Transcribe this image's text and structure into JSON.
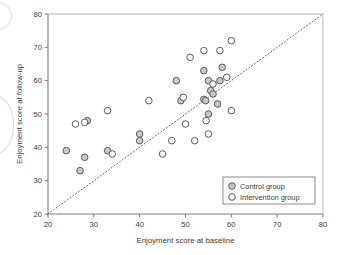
{
  "figure": {
    "width": 341,
    "height": 255,
    "background": "#ffffff"
  },
  "plot_area": {
    "left": 48,
    "top": 14,
    "right": 323,
    "bottom": 214
  },
  "colors": {
    "axis": "#7d7d7d",
    "frame": "#b9b9b9",
    "text": "#3a3a3a",
    "marker_stroke": "#5a5a5a",
    "control_fill": "#c9c9c9",
    "intervention_fill": "#ffffff",
    "reference_line": "#6e6e6e"
  },
  "legend": {
    "position": "bottom-right",
    "entries": [
      {
        "label": "Control group",
        "marker": "filled-circle",
        "fill": "#c9c9c9"
      },
      {
        "label": "Intervention group",
        "marker": "open-circle",
        "fill": "#ffffff"
      }
    ]
  },
  "annotations": {
    "reference_line_label": "line of equality",
    "scan_artifact_top": "partial-circle-artifact",
    "scan_artifact_mid": "partial-circle-artifact"
  },
  "chart_data": {
    "type": "scatter",
    "title": "",
    "subtitle": "",
    "xlabel": "Enjoyment score at baseline",
    "ylabel": "Enjoyment score at follow-up",
    "xlim": [
      20,
      80
    ],
    "ylim": [
      20,
      80
    ],
    "xticks": [
      20,
      30,
      40,
      50,
      60,
      70,
      80
    ],
    "yticks": [
      20,
      30,
      40,
      50,
      60,
      70,
      80
    ],
    "grid": false,
    "legend_position": "lower right",
    "reference_line": {
      "type": "identity",
      "style": "dotted",
      "from": [
        20,
        20
      ],
      "to": [
        80,
        80
      ]
    },
    "series": [
      {
        "name": "Control group",
        "marker": "filled-circle",
        "color": "#c9c9c9",
        "points": [
          [
            24,
            39
          ],
          [
            27,
            33
          ],
          [
            28,
            37
          ],
          [
            28.6,
            48
          ],
          [
            33,
            39
          ],
          [
            40,
            44
          ],
          [
            40,
            42
          ],
          [
            48,
            60
          ],
          [
            49,
            54
          ],
          [
            54,
            63
          ],
          [
            54,
            54.4
          ],
          [
            54.4,
            54
          ],
          [
            55,
            60
          ],
          [
            55,
            50
          ],
          [
            55.5,
            57
          ],
          [
            56,
            56
          ],
          [
            57,
            53
          ],
          [
            57.5,
            60
          ],
          [
            58,
            64
          ]
        ]
      },
      {
        "name": "Intervention group",
        "marker": "open-circle",
        "color": "#ffffff",
        "points": [
          [
            26,
            47
          ],
          [
            28,
            47.5
          ],
          [
            33,
            51
          ],
          [
            34,
            38
          ],
          [
            42,
            54
          ],
          [
            45,
            38
          ],
          [
            47,
            42
          ],
          [
            49.5,
            55
          ],
          [
            50,
            47
          ],
          [
            51,
            67
          ],
          [
            52,
            42
          ],
          [
            54,
            69
          ],
          [
            54.5,
            48
          ],
          [
            55,
            44
          ],
          [
            56,
            59
          ],
          [
            57.5,
            69
          ],
          [
            59,
            61
          ],
          [
            60,
            72
          ],
          [
            60,
            51
          ]
        ]
      }
    ]
  }
}
